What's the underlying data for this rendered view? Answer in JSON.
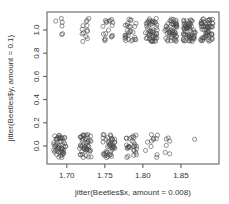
{
  "chart_data": {
    "type": "scatter",
    "title": "",
    "xlabel": "jitter(Beetles$x, amount = 0.008)",
    "ylabel": "jitter(Beetles$y, amount = 0.1)",
    "xlim": [
      1.674,
      1.9
    ],
    "ylim": [
      -0.155,
      1.155
    ],
    "x_ticks": [
      1.7,
      1.75,
      1.8,
      1.85
    ],
    "x_tick_labels": [
      "1.70",
      "1.75",
      "1.80",
      "1.85"
    ],
    "y_ticks": [
      0.0,
      0.2,
      0.4,
      0.6,
      0.8,
      1.0
    ],
    "y_tick_labels": [
      "0.0",
      "0.2",
      "0.4",
      "0.6",
      "0.8",
      "1.0"
    ],
    "grid": false,
    "legend": null,
    "marker": "open-circle",
    "jitter": {
      "x_amount": 0.008,
      "y_amount": 0.1
    },
    "groups": [
      {
        "x": 1.6907,
        "n_y1": 6,
        "n_y0": 53
      },
      {
        "x": 1.7242,
        "n_y1": 13,
        "n_y0": 47
      },
      {
        "x": 1.7552,
        "n_y1": 18,
        "n_y0": 44
      },
      {
        "x": 1.7842,
        "n_y1": 28,
        "n_y0": 28
      },
      {
        "x": 1.8113,
        "n_y1": 52,
        "n_y0": 11
      },
      {
        "x": 1.8369,
        "n_y1": 53,
        "n_y0": 6
      },
      {
        "x": 1.861,
        "n_y1": 61,
        "n_y0": 1
      },
      {
        "x": 1.8839,
        "n_y1": 60,
        "n_y0": 0
      }
    ],
    "colors": {
      "point": "#4a4a4a",
      "axis": "#555555",
      "text": "#333333"
    }
  }
}
